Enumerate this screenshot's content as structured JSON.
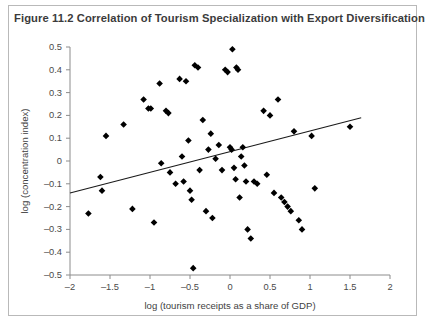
{
  "figure": {
    "title": "Figure 11.2  Correlation of Tourism Specialization with Export Diversification"
  },
  "chart_data": {
    "type": "scatter",
    "title": "Figure 11.2  Correlation of Tourism Specialization with Export Diversification",
    "xlabel": "log (tourism receipts as a share of GDP)",
    "ylabel": "log (concentration index)",
    "xlim": [
      -2,
      2
    ],
    "ylim": [
      -0.5,
      0.5
    ],
    "xticks": [
      -2,
      -1.5,
      -1,
      -0.5,
      0,
      0.5,
      1,
      1.5,
      2
    ],
    "xtick_labels": [
      "–2",
      "–1.5",
      "–1",
      "–0.5",
      "0",
      "0.5",
      "1",
      "1.5",
      "2"
    ],
    "yticks": [
      -0.5,
      -0.4,
      -0.3,
      -0.2,
      -0.1,
      0,
      0.1,
      0.2,
      0.3,
      0.4,
      0.5
    ],
    "ytick_labels": [
      "–0.5",
      "–0.4",
      "–0.3",
      "–0.2",
      "–0.1",
      "0",
      "0.1",
      "0.2",
      "0.3",
      "0.4",
      "0.5"
    ],
    "grid": false,
    "legend": false,
    "marker": "diamond",
    "marker_color": "#000000",
    "points": [
      [
        -1.77,
        -0.23
      ],
      [
        -1.62,
        -0.07
      ],
      [
        -1.6,
        -0.13
      ],
      [
        -1.55,
        0.11
      ],
      [
        -1.33,
        0.16
      ],
      [
        -1.22,
        -0.21
      ],
      [
        -1.08,
        0.27
      ],
      [
        -1.02,
        0.23
      ],
      [
        -0.99,
        0.23
      ],
      [
        -0.95,
        -0.27
      ],
      [
        -0.88,
        0.34
      ],
      [
        -0.86,
        -0.01
      ],
      [
        -0.8,
        0.22
      ],
      [
        -0.77,
        0.21
      ],
      [
        -0.75,
        -0.05
      ],
      [
        -0.68,
        -0.1
      ],
      [
        -0.63,
        0.36
      ],
      [
        -0.6,
        0.02
      ],
      [
        -0.58,
        -0.09
      ],
      [
        -0.55,
        0.35
      ],
      [
        -0.52,
        0.09
      ],
      [
        -0.5,
        -0.13
      ],
      [
        -0.48,
        -0.17
      ],
      [
        -0.46,
        -0.47
      ],
      [
        -0.44,
        0.42
      ],
      [
        -0.4,
        0.41
      ],
      [
        -0.38,
        -0.04
      ],
      [
        -0.34,
        0.18
      ],
      [
        -0.3,
        -0.22
      ],
      [
        -0.27,
        0.05
      ],
      [
        -0.24,
        0.12
      ],
      [
        -0.22,
        -0.25
      ],
      [
        -0.18,
        0.01
      ],
      [
        -0.14,
        0.07
      ],
      [
        -0.1,
        -0.04
      ],
      [
        -0.06,
        0.4
      ],
      [
        -0.03,
        0.39
      ],
      [
        0.0,
        0.06
      ],
      [
        0.02,
        0.05
      ],
      [
        0.03,
        0.49
      ],
      [
        0.05,
        -0.03
      ],
      [
        0.07,
        -0.08
      ],
      [
        0.08,
        0.41
      ],
      [
        0.1,
        0.4
      ],
      [
        0.12,
        -0.16
      ],
      [
        0.14,
        0.02
      ],
      [
        0.16,
        0.06
      ],
      [
        0.18,
        -0.02
      ],
      [
        0.2,
        -0.09
      ],
      [
        0.22,
        -0.3
      ],
      [
        0.26,
        -0.34
      ],
      [
        0.3,
        -0.09
      ],
      [
        0.34,
        -0.1
      ],
      [
        0.42,
        0.22
      ],
      [
        0.46,
        -0.06
      ],
      [
        0.5,
        0.2
      ],
      [
        0.55,
        -0.14
      ],
      [
        0.6,
        0.27
      ],
      [
        0.64,
        -0.16
      ],
      [
        0.68,
        -0.18
      ],
      [
        0.72,
        -0.2
      ],
      [
        0.76,
        -0.22
      ],
      [
        0.8,
        0.13
      ],
      [
        0.86,
        -0.26
      ],
      [
        0.9,
        -0.3
      ],
      [
        1.02,
        0.11
      ],
      [
        1.06,
        -0.12
      ],
      [
        1.5,
        0.15
      ]
    ],
    "trendline": {
      "x": [
        -2.0,
        1.64
      ],
      "y": [
        -0.14,
        0.19
      ]
    }
  }
}
